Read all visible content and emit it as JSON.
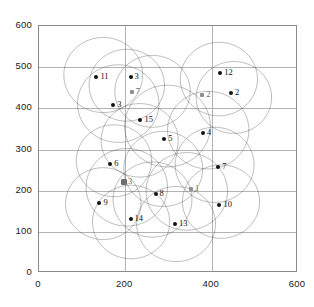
{
  "chart_data": {
    "type": "scatter",
    "title": "",
    "xlabel": "",
    "ylabel": "",
    "xlim": [
      0,
      600
    ],
    "ylim": [
      0,
      600
    ],
    "xticks": [
      0,
      200,
      400,
      600
    ],
    "yticks": [
      0,
      100,
      200,
      300,
      400,
      500,
      600
    ],
    "grid": true,
    "legend": "none",
    "annotations": "Each black point is a labelled node (1-15); grey square markers repeat labels 1, 2, 3 and 7 at alternate positions. Dotted circles of roughly equal radius are drawn around coverage centres.",
    "points": [
      {
        "label": "11",
        "x": 133,
        "y": 476,
        "color": "#111111",
        "marker": "dot"
      },
      {
        "label": "3",
        "x": 212,
        "y": 477,
        "color": "#111111",
        "marker": "dot"
      },
      {
        "label": "7",
        "x": 215,
        "y": 440,
        "color": "#8f8f8f",
        "marker": "square"
      },
      {
        "label": "3",
        "x": 172,
        "y": 407,
        "color": "#111111",
        "marker": "dot"
      },
      {
        "label": "15",
        "x": 235,
        "y": 372,
        "color": "#111111",
        "marker": "dot"
      },
      {
        "label": "5",
        "x": 290,
        "y": 325,
        "color": "#111111",
        "marker": "dot"
      },
      {
        "label": "12",
        "x": 420,
        "y": 487,
        "color": "#111111",
        "marker": "dot"
      },
      {
        "label": "2",
        "x": 378,
        "y": 432,
        "color": "#8f8f8f",
        "marker": "square"
      },
      {
        "label": "2",
        "x": 445,
        "y": 437,
        "color": "#111111",
        "marker": "dot"
      },
      {
        "label": "4",
        "x": 380,
        "y": 340,
        "color": "#111111",
        "marker": "dot"
      },
      {
        "label": "6",
        "x": 165,
        "y": 265,
        "color": "#111111",
        "marker": "dot"
      },
      {
        "label": "7",
        "x": 415,
        "y": 258,
        "color": "#111111",
        "marker": "dot"
      },
      {
        "label": "3",
        "x": 197,
        "y": 222,
        "color": "#6f6f6f",
        "marker": "cluster"
      },
      {
        "label": "1",
        "x": 352,
        "y": 205,
        "color": "#8f8f8f",
        "marker": "square"
      },
      {
        "label": "8",
        "x": 270,
        "y": 192,
        "color": "#111111",
        "marker": "dot"
      },
      {
        "label": "9",
        "x": 140,
        "y": 170,
        "color": "#111111",
        "marker": "dot"
      },
      {
        "label": "10",
        "x": 418,
        "y": 165,
        "color": "#111111",
        "marker": "dot"
      },
      {
        "label": "14",
        "x": 212,
        "y": 130,
        "color": "#111111",
        "marker": "dot"
      },
      {
        "label": "13",
        "x": 315,
        "y": 120,
        "color": "#111111",
        "marker": "dot"
      }
    ],
    "circles": [
      {
        "cx": 150,
        "cy": 480,
        "r": 92
      },
      {
        "cx": 205,
        "cy": 455,
        "r": 88
      },
      {
        "cx": 185,
        "cy": 410,
        "r": 95
      },
      {
        "cx": 265,
        "cy": 440,
        "r": 88
      },
      {
        "cx": 420,
        "cy": 470,
        "r": 90
      },
      {
        "cx": 455,
        "cy": 425,
        "r": 88
      },
      {
        "cx": 300,
        "cy": 355,
        "r": 100
      },
      {
        "cx": 395,
        "cy": 345,
        "r": 95
      },
      {
        "cx": 235,
        "cy": 320,
        "r": 90
      },
      {
        "cx": 175,
        "cy": 270,
        "r": 88
      },
      {
        "cx": 410,
        "cy": 260,
        "r": 92
      },
      {
        "cx": 290,
        "cy": 250,
        "r": 92
      },
      {
        "cx": 205,
        "cy": 205,
        "r": 95
      },
      {
        "cx": 150,
        "cy": 165,
        "r": 88
      },
      {
        "cx": 265,
        "cy": 175,
        "r": 92
      },
      {
        "cx": 345,
        "cy": 195,
        "r": 95
      },
      {
        "cx": 425,
        "cy": 170,
        "r": 90
      },
      {
        "cx": 215,
        "cy": 120,
        "r": 90
      },
      {
        "cx": 320,
        "cy": 115,
        "r": 92
      }
    ]
  },
  "axes": {
    "y_tick_labels": [
      "600",
      "500",
      "400",
      "300",
      "200",
      "100",
      "0"
    ],
    "x_tick_labels": [
      "0",
      "200",
      "400",
      "600"
    ],
    "origin_label": "0"
  },
  "colors": {
    "point": "#111111",
    "point_alt": "#8f8f8f",
    "circle_stroke": "#4a4a4a",
    "grid": "#b3b3b3",
    "frame": "#8a8a8a",
    "background": "#ffffff"
  }
}
